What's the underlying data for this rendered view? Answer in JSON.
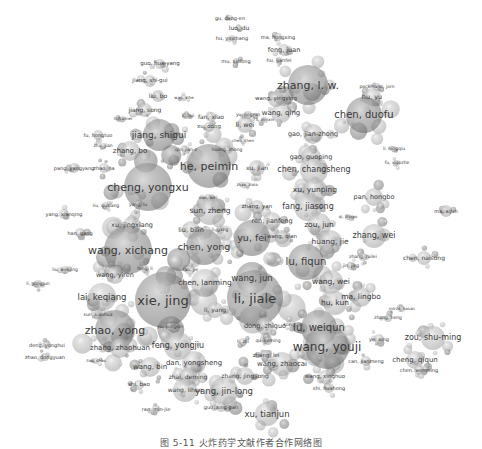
{
  "figure": {
    "type": "co-authorship network",
    "caption": "图 5-11 火炸药学文献作者合作网络图",
    "node_color": "#9a9a9a",
    "label_color": "#3a3a3a"
  },
  "nodes": [
    {
      "label": "gu, dang-en",
      "x": 230,
      "y": 18,
      "size": 5,
      "r": 3
    },
    {
      "label": "luo, du",
      "x": 239,
      "y": 28,
      "size": 6,
      "r": 3
    },
    {
      "label": "hu, yinchang",
      "x": 232,
      "y": 38,
      "size": 5,
      "r": 3
    },
    {
      "label": "ma, hongxing",
      "x": 278,
      "y": 37,
      "size": 5,
      "r": 4
    },
    {
      "label": "feng, juan",
      "x": 284,
      "y": 50,
      "size": 6.5,
      "r": 6
    },
    {
      "label": "mu, xiolong",
      "x": 236,
      "y": 61,
      "size": 5,
      "r": 3
    },
    {
      "label": "hu, jianfei",
      "x": 279,
      "y": 60,
      "size": 5,
      "r": 3
    },
    {
      "label": "guo, hua-yang",
      "x": 160,
      "y": 64,
      "size": 5.5,
      "r": 5
    },
    {
      "label": "jiang, shi-gui",
      "x": 150,
      "y": 81,
      "size": 5.5,
      "r": 6
    },
    {
      "label": "liu, bo",
      "x": 158,
      "y": 96,
      "size": 6,
      "r": 6
    },
    {
      "label": "wan, xihe",
      "x": 184,
      "y": 98,
      "size": 4,
      "r": 3
    },
    {
      "label": "jiang, song",
      "x": 145,
      "y": 110,
      "size": 6,
      "r": 7
    },
    {
      "label": "li, haimei",
      "x": 123,
      "y": 119,
      "size": 4,
      "r": 3
    },
    {
      "label": "li, bui",
      "x": 188,
      "y": 116,
      "size": 4.5,
      "r": 3
    },
    {
      "label": "fan, xiao",
      "x": 211,
      "y": 117,
      "size": 6,
      "r": 5
    },
    {
      "label": "xu, dong",
      "x": 209,
      "y": 127,
      "size": 5.5,
      "r": 5
    },
    {
      "label": "yu, lingrun",
      "x": 248,
      "y": 115,
      "size": 4.5,
      "r": 4
    },
    {
      "label": "li, wei",
      "x": 245,
      "y": 125,
      "size": 6.5,
      "r": 8
    },
    {
      "label": "wang, qing",
      "x": 281,
      "y": 113,
      "size": 7,
      "r": 10
    },
    {
      "label": "li, xin-xin",
      "x": 265,
      "y": 120,
      "size": 4,
      "r": 3
    },
    {
      "label": "zhang, l. w.",
      "x": 308,
      "y": 85,
      "size": 11,
      "r": 20
    },
    {
      "label": "wang, yingying",
      "x": 276,
      "y": 99,
      "size": 5.5,
      "r": 8
    },
    {
      "label": "peckmann, jorn",
      "x": 377,
      "y": 87,
      "size": 4.5,
      "r": 4
    },
    {
      "label": "hu, yu",
      "x": 372,
      "y": 97,
      "size": 6.5,
      "r": 9
    },
    {
      "label": "chen, duofu",
      "x": 364,
      "y": 115,
      "size": 10,
      "r": 18
    },
    {
      "label": "gao, jian-zhong",
      "x": 313,
      "y": 134,
      "size": 6.5,
      "r": 10
    },
    {
      "label": "fu, hongtuo",
      "x": 98,
      "y": 135,
      "size": 5,
      "r": 5
    },
    {
      "label": "jiang, shigui",
      "x": 159,
      "y": 135,
      "size": 9,
      "r": 16
    },
    {
      "label": "zhang, bo",
      "x": 130,
      "y": 151,
      "size": 7,
      "r": 10
    },
    {
      "label": "zhu, jian",
      "x": 103,
      "y": 146,
      "size": 4.5,
      "r": 3
    },
    {
      "label": "qin, jian-z",
      "x": 186,
      "y": 150,
      "size": 4.5,
      "r": 4
    },
    {
      "label": "chen, chen",
      "x": 243,
      "y": 141,
      "size": 4,
      "r": 3
    },
    {
      "label": "huang, zhong",
      "x": 227,
      "y": 150,
      "size": 4.5,
      "r": 4
    },
    {
      "label": "gao, guoping",
      "x": 311,
      "y": 157,
      "size": 6.5,
      "r": 10
    },
    {
      "label": "li, ningqiu",
      "x": 394,
      "y": 149,
      "size": 4.5,
      "r": 3
    },
    {
      "label": "fu, xiaozhe",
      "x": 397,
      "y": 163,
      "size": 4.5,
      "r": 3
    },
    {
      "label": "pang, yangyang",
      "x": 74,
      "y": 168,
      "size": 5,
      "r": 5
    },
    {
      "label": "zhao, na",
      "x": 104,
      "y": 168,
      "size": 5,
      "r": 5
    },
    {
      "label": "he, peimin",
      "x": 209,
      "y": 166,
      "size": 11,
      "r": 22
    },
    {
      "label": "xu, jian",
      "x": 257,
      "y": 168,
      "size": 6,
      "r": 8
    },
    {
      "label": "chen, changsheng",
      "x": 314,
      "y": 170,
      "size": 8,
      "r": 14
    },
    {
      "label": "zhao, zixia",
      "x": 247,
      "y": 185,
      "size": 4,
      "r": 3
    },
    {
      "label": "cheng, yongxu",
      "x": 148,
      "y": 187,
      "size": 11,
      "r": 24
    },
    {
      "label": "xu, yunping",
      "x": 315,
      "y": 190,
      "size": 7.5,
      "r": 12
    },
    {
      "label": "xue, wei",
      "x": 208,
      "y": 198,
      "size": 4.5,
      "r": 4
    },
    {
      "label": "pan, hongbo",
      "x": 374,
      "y": 197,
      "size": 6.5,
      "r": 9
    },
    {
      "label": "liu, quxiang",
      "x": 106,
      "y": 206,
      "size": 4.5,
      "r": 4
    },
    {
      "label": "yang, lu",
      "x": 138,
      "y": 205,
      "size": 4.5,
      "r": 4
    },
    {
      "label": "sun, zheng",
      "x": 210,
      "y": 211,
      "size": 7.5,
      "r": 14
    },
    {
      "label": "zhang, yan",
      "x": 257,
      "y": 207,
      "size": 5.5,
      "r": 7
    },
    {
      "label": "fang, jiasong",
      "x": 308,
      "y": 207,
      "size": 8,
      "r": 14
    },
    {
      "label": "yang, xianqing",
      "x": 64,
      "y": 214,
      "size": 5,
      "r": 5
    },
    {
      "label": "ma, aijun",
      "x": 446,
      "y": 211,
      "size": 5,
      "r": 6
    },
    {
      "label": "xu, jingxiang",
      "x": 132,
      "y": 225,
      "size": 6.5,
      "r": 9
    },
    {
      "label": "ren, jianfeng",
      "x": 272,
      "y": 221,
      "size": 6.5,
      "r": 9
    },
    {
      "label": "qi, zhirao",
      "x": 348,
      "y": 217,
      "size": 4,
      "r": 3
    },
    {
      "label": "zou, jun",
      "x": 319,
      "y": 225,
      "size": 7.5,
      "r": 12
    },
    {
      "label": "han, gang",
      "x": 80,
      "y": 233,
      "size": 5,
      "r": 5
    },
    {
      "label": "liu, bilin",
      "x": 191,
      "y": 230,
      "size": 6.5,
      "r": 9
    },
    {
      "label": "li, gang",
      "x": 220,
      "y": 230,
      "size": 4.5,
      "r": 4
    },
    {
      "label": "zhang, wei",
      "x": 374,
      "y": 236,
      "size": 8,
      "r": 12
    },
    {
      "label": "wang, xichang",
      "x": 128,
      "y": 250,
      "size": 11,
      "r": 24
    },
    {
      "label": "chen, yong",
      "x": 204,
      "y": 247,
      "size": 9.5,
      "r": 18
    },
    {
      "label": "yu, fei",
      "x": 252,
      "y": 238,
      "size": 9.5,
      "r": 18
    },
    {
      "label": "wang, qian",
      "x": 282,
      "y": 237,
      "size": 5.5,
      "r": 7
    },
    {
      "label": "huang, jie",
      "x": 330,
      "y": 242,
      "size": 7.5,
      "r": 12
    },
    {
      "label": "liu, wenjing",
      "x": 65,
      "y": 270,
      "size": 4.5,
      "r": 4
    },
    {
      "label": "wang, yiren",
      "x": 115,
      "y": 275,
      "size": 6.5,
      "r": 9
    },
    {
      "label": "feng, li",
      "x": 145,
      "y": 269,
      "size": 4.5,
      "r": 4
    },
    {
      "label": "cao, jie",
      "x": 190,
      "y": 270,
      "size": 4.5,
      "r": 5
    },
    {
      "label": "li, yongjun",
      "x": 38,
      "y": 284,
      "size": 4.5,
      "r": 4
    },
    {
      "label": "chen, lanming",
      "x": 205,
      "y": 283,
      "size": 7.5,
      "r": 14
    },
    {
      "label": "wang, jun",
      "x": 252,
      "y": 278,
      "size": 8.5,
      "r": 16
    },
    {
      "label": "lu, fiqun",
      "x": 306,
      "y": 262,
      "size": 10,
      "r": 18
    },
    {
      "label": "zhang, ruilei",
      "x": 363,
      "y": 257,
      "size": 4.5,
      "r": 4
    },
    {
      "label": "jin, jing",
      "x": 351,
      "y": 266,
      "size": 4.5,
      "r": 4
    },
    {
      "label": "chen, naisong",
      "x": 424,
      "y": 258,
      "size": 6,
      "r": 7
    },
    {
      "label": "wang, wei",
      "x": 331,
      "y": 282,
      "size": 7.5,
      "r": 12
    },
    {
      "label": "lai, keqiang",
      "x": 102,
      "y": 297,
      "size": 8.5,
      "r": 14
    },
    {
      "label": "xie, jing",
      "x": 163,
      "y": 300,
      "size": 13,
      "r": 28
    },
    {
      "label": "li, jiale",
      "x": 255,
      "y": 298,
      "size": 13,
      "r": 28
    },
    {
      "label": "li, yang",
      "x": 215,
      "y": 310,
      "size": 6,
      "r": 8
    },
    {
      "label": "hu, kun",
      "x": 335,
      "y": 303,
      "size": 7.5,
      "r": 12
    },
    {
      "label": "ma, lingbo",
      "x": 361,
      "y": 297,
      "size": 7.5,
      "r": 10
    },
    {
      "label": "mirzo, hasan",
      "x": 402,
      "y": 309,
      "size": 4,
      "r": 3
    },
    {
      "label": "sun, xiaohua",
      "x": 98,
      "y": 315,
      "size": 4.5,
      "r": 4
    },
    {
      "label": "zhang, heng",
      "x": 388,
      "y": 318,
      "size": 4.5,
      "r": 4
    },
    {
      "label": "zhao, yong",
      "x": 115,
      "y": 330,
      "size": 11,
      "r": 20
    },
    {
      "label": "yu, yongsin",
      "x": 170,
      "y": 327,
      "size": 4.5,
      "r": 4
    },
    {
      "label": "dong, zhiguo",
      "x": 265,
      "y": 326,
      "size": 6.5,
      "r": 9
    },
    {
      "label": "kong, jie",
      "x": 293,
      "y": 325,
      "size": 4.5,
      "r": 4
    },
    {
      "label": "lu, weiqun",
      "x": 319,
      "y": 328,
      "size": 10,
      "r": 18
    },
    {
      "label": "ye, xing",
      "x": 379,
      "y": 339,
      "size": 5,
      "r": 5
    },
    {
      "label": "zou, shu-ming",
      "x": 433,
      "y": 338,
      "size": 8,
      "r": 12
    },
    {
      "label": "deng, yonghui",
      "x": 47,
      "y": 345,
      "size": 5,
      "r": 4
    },
    {
      "label": "zhang, zhaohuan",
      "x": 120,
      "y": 348,
      "size": 7,
      "r": 10
    },
    {
      "label": "feng, yongjiu",
      "x": 178,
      "y": 346,
      "size": 8,
      "r": 14
    },
    {
      "label": "li, zhi",
      "x": 243,
      "y": 342,
      "size": 4.5,
      "r": 4
    },
    {
      "label": "qu, keming",
      "x": 268,
      "y": 341,
      "size": 4.5,
      "r": 4
    },
    {
      "label": "wang, youji",
      "x": 327,
      "y": 347,
      "size": 12,
      "r": 22
    },
    {
      "label": "zhao, dongyuan",
      "x": 45,
      "y": 357,
      "size": 5,
      "r": 4
    },
    {
      "label": "liao, shao",
      "x": 96,
      "y": 361,
      "size": 4,
      "r": 3
    },
    {
      "label": "zhang, lei",
      "x": 266,
      "y": 356,
      "size": 5.5,
      "r": 6
    },
    {
      "label": "can, jianmeng",
      "x": 366,
      "y": 361,
      "size": 5,
      "r": 5
    },
    {
      "label": "cheng, qiqun",
      "x": 415,
      "y": 360,
      "size": 7,
      "r": 9
    },
    {
      "label": "wang, bin",
      "x": 150,
      "y": 367,
      "size": 7,
      "r": 10
    },
    {
      "label": "dan, yongsheng",
      "x": 194,
      "y": 363,
      "size": 7,
      "r": 12
    },
    {
      "label": "wang, zhaocai",
      "x": 282,
      "y": 364,
      "size": 7,
      "r": 12
    },
    {
      "label": "chen, wenming",
      "x": 419,
      "y": 370,
      "size": 5,
      "r": 5
    },
    {
      "label": "zhai, deming",
      "x": 188,
      "y": 377,
      "size": 6,
      "r": 9
    },
    {
      "label": "zhang, jingsong",
      "x": 245,
      "y": 376,
      "size": 6,
      "r": 9
    },
    {
      "label": "wang, xinghuo",
      "x": 325,
      "y": 377,
      "size": 5.5,
      "r": 7
    },
    {
      "label": "shi, bao",
      "x": 139,
      "y": 385,
      "size": 5.5,
      "r": 5
    },
    {
      "label": "wang, lihua",
      "x": 185,
      "y": 390,
      "size": 6,
      "r": 12
    },
    {
      "label": "yang, jin-long",
      "x": 224,
      "y": 391,
      "size": 8.5,
      "r": 14
    },
    {
      "label": "shi, huahong",
      "x": 329,
      "y": 388,
      "size": 5,
      "r": 5
    },
    {
      "label": "rao, min-jie",
      "x": 156,
      "y": 409,
      "size": 5,
      "r": 4
    },
    {
      "label": "guo, xing-pan",
      "x": 221,
      "y": 407,
      "size": 5,
      "r": 5
    },
    {
      "label": "xu, tianjun",
      "x": 267,
      "y": 414,
      "size": 8.5,
      "r": 12
    }
  ]
}
